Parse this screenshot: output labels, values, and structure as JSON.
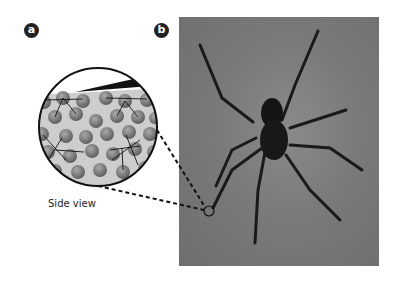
{
  "panels": [
    {
      "label": "a",
      "description": "Magnified side view of water surface showing water molecules bonded by hydrogen bonds, with spider leg tip pressing on surface"
    },
    {
      "label": "b",
      "description": "Photograph of a spider standing on water surface; small circle marks contact point of a leg"
    }
  ],
  "caption": "Side view",
  "colors": {
    "badge": "#222222",
    "molecule": "#7b7b7b",
    "water": "#c8c8c8",
    "photo_bg": "#7a7a7a",
    "spider": "#1a1a1a"
  }
}
